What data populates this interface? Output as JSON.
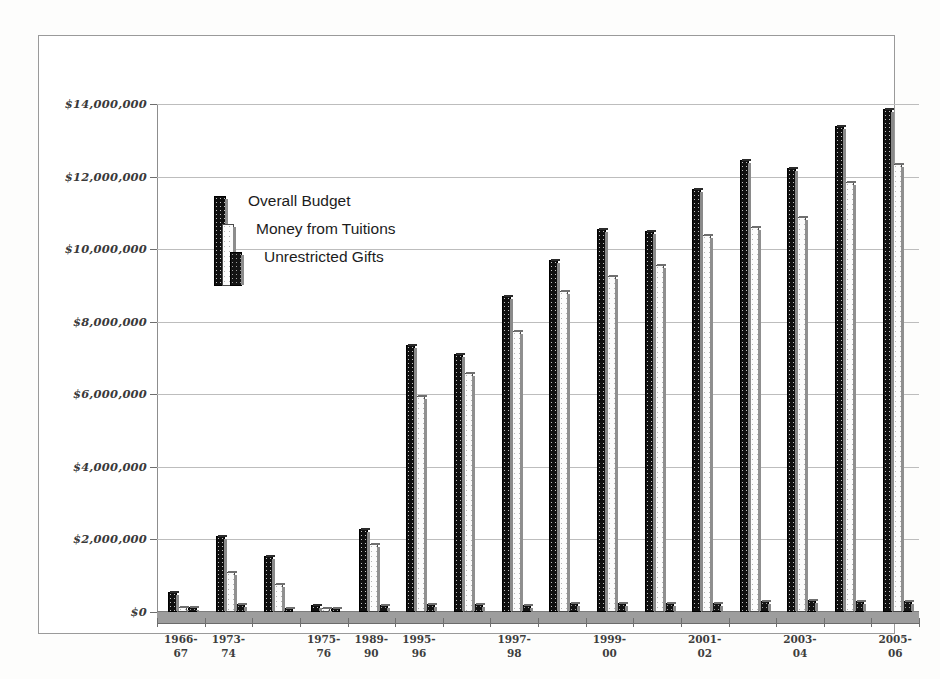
{
  "chart_data": {
    "type": "bar",
    "title": "",
    "xlabel": "",
    "ylabel": "",
    "ylim": [
      0,
      14000000
    ],
    "ytick_values": [
      0,
      2000000,
      4000000,
      6000000,
      8000000,
      10000000,
      12000000,
      14000000
    ],
    "ytick_labels": [
      "$0",
      "$2,000,000",
      "$4,000,000",
      "$6,000,000",
      "$8,000,000",
      "$10,000,000",
      "$12,000,000",
      "$14,000,000"
    ],
    "grid": true,
    "legend_position": "inside-upper-left",
    "categories": [
      "1966-67",
      "1973-74",
      "",
      "1975-76",
      "1989-90",
      "1995-96",
      "",
      "1997-98",
      "",
      "1999-00",
      "",
      "2001-02",
      "",
      "2003-04",
      "",
      "2005-06"
    ],
    "xtick_labels_visible": [
      "1966-\n67",
      "1973-\n74",
      "1975-\n76",
      "1989-\n90",
      "1995-\n96",
      "1997-\n98",
      "1999-\n00",
      "2001-\n02",
      "2003-\n04",
      "2005-\n06"
    ],
    "series": [
      {
        "name": "Overall Budget",
        "color": "#101010",
        "values": [
          550000,
          2100000,
          1550000,
          180000,
          2300000,
          7350000,
          7100000,
          8700000,
          9700000,
          10550000,
          10500000,
          11650000,
          12450000,
          12250000,
          13400000,
          13850000
        ]
      },
      {
        "name": "Money from Tuitions",
        "color": "#fbfbfb",
        "values": [
          150000,
          1100000,
          780000,
          120000,
          1880000,
          5950000,
          6600000,
          7750000,
          8850000,
          9250000,
          9550000,
          10400000,
          10600000,
          10900000,
          11850000,
          12350000
        ]
      },
      {
        "name": "Unrestricted Gifts",
        "color": "#141414",
        "values": [
          130000,
          230000,
          110000,
          100000,
          200000,
          210000,
          220000,
          190000,
          250000,
          260000,
          250000,
          260000,
          300000,
          320000,
          300000,
          310000
        ]
      }
    ]
  },
  "legend": {
    "items": [
      {
        "label": "Overall Budget"
      },
      {
        "label": "Money from Tuitions"
      },
      {
        "label": "Unrestricted Gifts"
      }
    ]
  }
}
